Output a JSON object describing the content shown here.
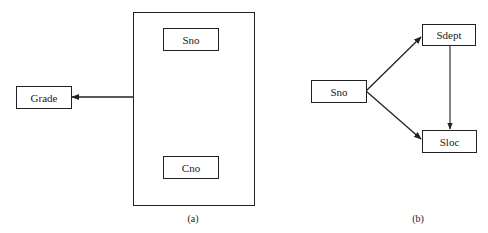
{
  "diagram_a": {
    "caption": "(a)",
    "external_node": {
      "label": "Grade"
    },
    "group_nodes": [
      {
        "label": "Sno"
      },
      {
        "label": "Cno"
      }
    ],
    "edges": [
      {
        "from": "group(Sno,Cno)",
        "to": "Grade"
      }
    ]
  },
  "diagram_b": {
    "caption": "(b)",
    "nodes": [
      {
        "label": "Sno"
      },
      {
        "label": "Sdept"
      },
      {
        "label": "Sloc"
      }
    ],
    "edges": [
      {
        "from": "Sno",
        "to": "Sdept"
      },
      {
        "from": "Sno",
        "to": "Sloc"
      },
      {
        "from": "Sdept",
        "to": "Sloc"
      }
    ]
  }
}
